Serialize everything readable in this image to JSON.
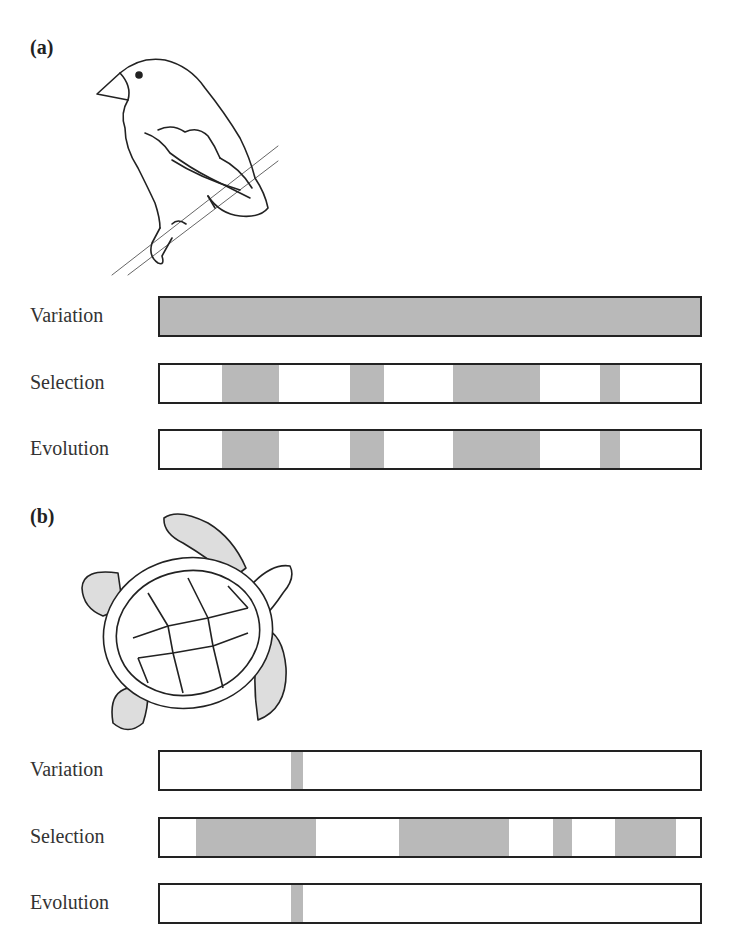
{
  "panels": [
    {
      "label": "(a)",
      "organism_icon": "finch-illustration",
      "rows": [
        {
          "label": "Variation",
          "fill": "full",
          "segments": [
            [
              0,
              100
            ]
          ]
        },
        {
          "label": "Selection",
          "segments": [
            [
              11.5,
              22.0
            ],
            [
              35.2,
              41.5
            ],
            [
              54.3,
              70.4
            ],
            [
              81.9,
              85.6
            ]
          ]
        },
        {
          "label": "Evolution",
          "segments": [
            [
              11.5,
              22.0
            ],
            [
              35.2,
              41.5
            ],
            [
              54.3,
              70.4
            ],
            [
              81.9,
              85.6
            ]
          ]
        }
      ]
    },
    {
      "label": "(b)",
      "organism_icon": "sea-turtle-illustration",
      "rows": [
        {
          "label": "Variation",
          "segments": [
            [
              24.4,
              26.7
            ]
          ]
        },
        {
          "label": "Selection",
          "segments": [
            [
              6.8,
              29.0
            ],
            [
              44.5,
              64.8
            ],
            [
              72.9,
              76.4
            ],
            [
              84.5,
              95.7
            ]
          ]
        },
        {
          "label": "Evolution",
          "segments": [
            [
              24.4,
              26.7
            ]
          ]
        }
      ]
    }
  ],
  "colors": {
    "shade": "#b9b9b9",
    "outline": "#222222",
    "background": "#ffffff"
  }
}
